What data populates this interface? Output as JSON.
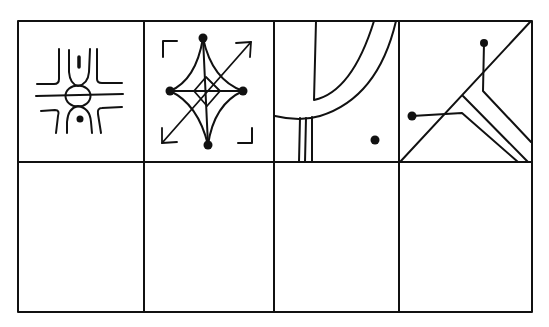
{
  "figure": {
    "title": "Symbol grid puzzle",
    "rows": 2,
    "columns": 4,
    "line_color": "#111111",
    "background": "#ffffff",
    "top_row": [
      {
        "index": 1,
        "description": "Crossed horizontal lines with central circle, U-shaped arches above and below, dash above and dot below"
      },
      {
        "index": 2,
        "description": "Four-pointed curved star with dots at each point, inner diamond and cross, diagonal double-headed arrow, corner brackets"
      },
      {
        "index": 3,
        "description": "Nested curved arcs from top edge, three vertical lines under the outer arc, single dot at bottom right"
      },
      {
        "index": 4,
        "description": "Diagonal line across cell with branching parallel lines, two dot-ended stems"
      }
    ],
    "bottom_row": [
      {
        "index": 5,
        "description": "empty"
      },
      {
        "index": 6,
        "description": "empty"
      },
      {
        "index": 7,
        "description": "empty"
      },
      {
        "index": 8,
        "description": "empty"
      }
    ]
  }
}
